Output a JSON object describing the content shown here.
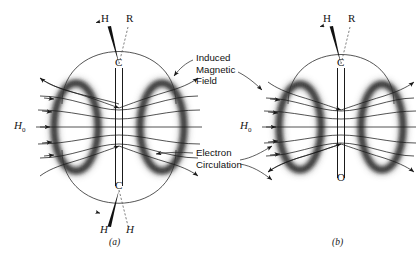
{
  "figure": {
    "background_color": "#ffffff",
    "ink_color": "#1a1a1a",
    "torus_color": "#4a4a4a",
    "panels": [
      {
        "id": "a",
        "caption": "(a)",
        "center_x": 119,
        "functional_group": "C=C",
        "top_substituents": [
          "H",
          "R"
        ],
        "bottom_substituents": [
          "H",
          "H"
        ],
        "atom_top": "C",
        "atom_bottom": "C",
        "applied_field_label": "H",
        "applied_field_sub": "0"
      },
      {
        "id": "b",
        "caption": "(b)",
        "center_x": 341,
        "functional_group": "C=O",
        "top_substituents": [
          "H",
          "R"
        ],
        "bottom_substituents": [],
        "atom_top": "C",
        "atom_bottom": "O",
        "applied_field_label": "H",
        "applied_field_sub": "0"
      }
    ],
    "annotations": [
      {
        "id": "induced-magnetic-field",
        "lines": [
          "Induced",
          "Magnetic",
          "Field"
        ],
        "x": 196,
        "y": 57
      },
      {
        "id": "electron-circulation",
        "lines": [
          "Electron",
          "Circulation"
        ],
        "x": 196,
        "y": 149
      }
    ],
    "labels": {
      "panel_a_top_h": "H",
      "panel_a_top_r": "R",
      "panel_a_c_upper": "C",
      "panel_a_c_lower": "C",
      "panel_a_bottom_h_left": "H",
      "panel_a_bottom_h_right": "H",
      "panel_a_h0": "H",
      "panel_a_h0_sub": "0",
      "panel_a_caption": "(a)",
      "panel_b_top_h": "H",
      "panel_b_top_r": "R",
      "panel_b_c": "C",
      "panel_b_o": "O",
      "panel_b_h0": "H",
      "panel_b_h0_sub": "0",
      "panel_b_caption": "(b)",
      "induced_line1": "Induced",
      "induced_line2": "Magnetic",
      "induced_line3": "Field",
      "electron_line1": "Electron",
      "electron_line2": "Circulation"
    }
  }
}
